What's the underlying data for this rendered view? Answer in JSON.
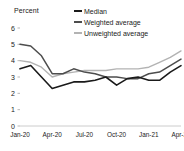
{
  "axis_title": "Percent",
  "legend": [
    {
      "label": "Median",
      "color": "#1a1a1a"
    },
    {
      "label": "Weighted average",
      "color": "#4d4d4d"
    },
    {
      "label": "Unweighted average",
      "color": "#b3b3b3"
    }
  ],
  "chart_data": {
    "type": "line",
    "title": "",
    "subtitle": "",
    "xlabel": "",
    "ylabel": "Percent",
    "ylim": [
      0,
      6
    ],
    "yticks": [
      0,
      1,
      2,
      3,
      4,
      5,
      6
    ],
    "grid": false,
    "legend_position": "top-right",
    "x": [
      "Jan-20",
      "Feb-20",
      "Mar-20",
      "Apr-20",
      "May-20",
      "Jun-20",
      "Jul-20",
      "Aug-20",
      "Sep-20",
      "Oct-20",
      "Nov-20",
      "Dec-20",
      "Jan-21",
      "Feb-21",
      "Mar-21",
      "Apr-21"
    ],
    "xtick_labels": [
      "Jan-20",
      "Apr-20",
      "Jul-20",
      "Oct-20",
      "Jan-21",
      "Apr-21"
    ],
    "xtick_indices": [
      0,
      3,
      6,
      9,
      12,
      15
    ],
    "series": [
      {
        "name": "Median",
        "color": "#1a1a1a",
        "values": [
          3.5,
          3.7,
          3.0,
          2.3,
          2.5,
          2.7,
          2.7,
          2.8,
          3.0,
          2.5,
          2.9,
          3.0,
          2.8,
          2.8,
          3.3,
          3.7
        ]
      },
      {
        "name": "Weighted average",
        "color": "#4d4d4d",
        "values": [
          5.0,
          4.9,
          4.3,
          3.2,
          3.2,
          3.5,
          3.3,
          3.2,
          3.0,
          3.0,
          2.9,
          2.9,
          3.2,
          3.3,
          3.7,
          4.1
        ]
      },
      {
        "name": "Unweighted average",
        "color": "#b3b3b3",
        "values": [
          4.0,
          3.9,
          3.6,
          3.0,
          3.2,
          3.3,
          3.4,
          3.4,
          3.4,
          3.5,
          3.5,
          3.5,
          3.6,
          3.9,
          4.2,
          4.6
        ]
      }
    ]
  }
}
